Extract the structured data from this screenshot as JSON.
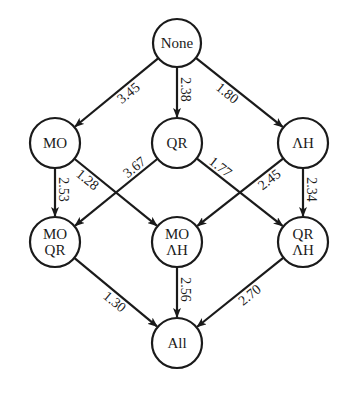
{
  "colors": {
    "stroke": "#1a1a1a",
    "background": "#ffffff"
  },
  "nodes": [
    {
      "id": "none",
      "lines": [
        "None"
      ],
      "x": 177,
      "y": 43,
      "r": 24
    },
    {
      "id": "mo",
      "lines": [
        "MO"
      ],
      "x": 55,
      "y": 143,
      "r": 25
    },
    {
      "id": "qr",
      "lines": [
        "QR"
      ],
      "x": 177,
      "y": 143,
      "r": 25
    },
    {
      "id": "ah",
      "lines": [
        "ΛH"
      ],
      "x": 303,
      "y": 143,
      "r": 25
    },
    {
      "id": "mo_qr",
      "lines": [
        "MO",
        "QR"
      ],
      "x": 55,
      "y": 242,
      "r": 25
    },
    {
      "id": "mo_ah",
      "lines": [
        "MO",
        "ΛH"
      ],
      "x": 177,
      "y": 242,
      "r": 25
    },
    {
      "id": "qr_ah",
      "lines": [
        "QR",
        "ΛH"
      ],
      "x": 303,
      "y": 242,
      "r": 25
    },
    {
      "id": "all",
      "lines": [
        "All"
      ],
      "x": 177,
      "y": 343,
      "r": 25
    }
  ],
  "edges": [
    {
      "from": "none",
      "to": "mo",
      "label": "3.45",
      "t": 0.42,
      "side": -1
    },
    {
      "from": "none",
      "to": "qr",
      "label": "2.38",
      "t": 0.45,
      "side": -1
    },
    {
      "from": "none",
      "to": "ah",
      "label": "1.80",
      "t": 0.42,
      "side": 1
    },
    {
      "from": "mo",
      "to": "mo_qr",
      "label": "2.53",
      "t": 0.45,
      "side": -1
    },
    {
      "from": "mo",
      "to": "mo_ah",
      "label": "1.28",
      "t": 0.22,
      "side": 1
    },
    {
      "from": "qr",
      "to": "mo_qr",
      "label": "3.67",
      "t": 0.22,
      "side": 1
    },
    {
      "from": "qr",
      "to": "qr_ah",
      "label": "1.77",
      "t": 0.22,
      "side": -1
    },
    {
      "from": "ah",
      "to": "mo_ah",
      "label": "2.45",
      "t": 0.22,
      "side": -1
    },
    {
      "from": "ah",
      "to": "qr_ah",
      "label": "2.34",
      "t": 0.45,
      "side": -1
    },
    {
      "from": "mo_qr",
      "to": "all",
      "label": "1.30",
      "t": 0.55,
      "side": 1
    },
    {
      "from": "mo_ah",
      "to": "all",
      "label": "2.56",
      "t": 0.45,
      "side": -1
    },
    {
      "from": "qr_ah",
      "to": "all",
      "label": "2.70",
      "t": 0.45,
      "side": -1
    }
  ]
}
